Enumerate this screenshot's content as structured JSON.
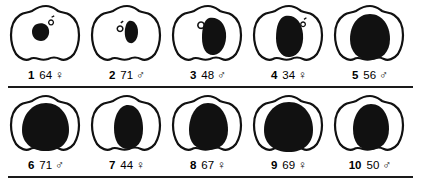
{
  "figure": {
    "title": "",
    "outline_color": "#111111",
    "fill_color": "#111111",
    "background_color": "#ffffff",
    "rule_color": "#1a1a1a"
  },
  "rows": [
    {
      "row_id": "row-1",
      "specimens": [
        {
          "number": "1",
          "age": "64",
          "sex": "♀",
          "fill_level": 1
        },
        {
          "number": "2",
          "age": "71",
          "sex": "♂",
          "fill_level": 2
        },
        {
          "number": "3",
          "age": "48",
          "sex": "♂",
          "fill_level": 3
        },
        {
          "number": "4",
          "age": "34",
          "sex": "♀",
          "fill_level": 4
        },
        {
          "number": "5",
          "age": "56",
          "sex": "♂",
          "fill_level": 5
        }
      ]
    },
    {
      "row_id": "row-2",
      "specimens": [
        {
          "number": "6",
          "age": "71",
          "sex": "♂",
          "fill_level": 6
        },
        {
          "number": "7",
          "age": "44",
          "sex": "♀",
          "fill_level": 7
        },
        {
          "number": "8",
          "age": "67",
          "sex": "♀",
          "fill_level": 8
        },
        {
          "number": "9",
          "age": "69",
          "sex": "♀",
          "fill_level": 9
        },
        {
          "number": "10",
          "age": "50",
          "sex": "♂",
          "fill_level": 10
        }
      ]
    }
  ],
  "shapes": {
    "outline_path": "M40 4 C46 4 49 7 52 9 C56 11 60 10 64 13 C70 17 73 25 73 33 C73 41 71 47 68 52 C64 57 58 59 54 57 C50 55 46 55 42 57 C39 58 36 58 33 57 C30 56 27 55 24 57 C20 59 14 57 10 52 C7 47 5 41 5 33 C5 25 8 17 14 13 C18 10 22 11 26 9 C29 7 33 4 40 4 Z",
    "fills": {
      "1": "M31 22 C36 20 42 22 43 28 C44 34 40 39 35 39 C30 39 26 35 26 30 C26 26 28 23 31 22 Z",
      "2": "M42 19 C47 18 51 23 51 30 C51 37 47 42 43 41 C39 40 37 34 38 27 C39 22 40 20 42 19 Z",
      "3": "M41 16 C50 14 57 21 58 31 C59 42 54 52 46 53 C39 54 34 47 34 36 C34 26 36 18 41 16 Z",
      "4": "M36 14 C46 12 53 20 54 32 C55 44 50 54 41 55 C33 56 27 48 27 36 C27 24 30 16 36 14 Z",
      "5": "M40 12 C52 12 60 23 60 37 C60 50 52 58 40 58 C28 58 20 50 20 37 C20 23 28 12 40 12 Z",
      "6": "M40 11 C54 11 63 23 63 38 C63 51 54 59 40 59 C26 59 16 51 16 38 C16 23 26 11 40 11 Z",
      "7": "M41 13 C51 13 56 24 56 37 C56 50 50 57 41 57 C32 57 27 49 27 36 C27 23 33 13 41 13 Z",
      "8": "M40 11 C53 11 60 24 60 38 C60 51 52 58 40 58 C28 58 21 51 21 38 C21 24 28 11 40 11 Z",
      "9": "M40 10 C55 10 64 23 64 38 C64 52 54 60 40 60 C25 60 15 52 15 38 C15 23 25 10 40 10 Z",
      "10": "M41 12 C53 12 59 24 59 37 C59 50 51 58 40 58 C29 58 23 50 23 37 C23 24 30 12 41 12 Z"
    },
    "notch": {
      "2": "M33 23 a3.2 3.2 0 1 0 0.1 0 Z",
      "3": "M31 21 a3.4 3.4 0 1 0 0.1 0 Z"
    }
  }
}
